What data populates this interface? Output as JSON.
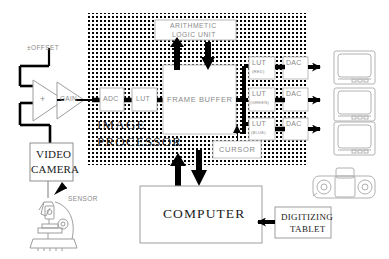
{
  "diagram": {
    "type": "block-diagram",
    "colors": {
      "line": "#000000",
      "stipple": "#000000",
      "box_fill": "#ffffff",
      "faint_text": "#8a8a8a",
      "illustration": "#9a9a9a"
    }
  },
  "input_chain": {
    "offset_label": "±OFFSET",
    "sum_amp_label": "+",
    "gain_amp_label": "GAIN",
    "camera_label_line1": "VIDEO",
    "camera_label_line2": "CAMERA",
    "sensor_label": "SENSOR",
    "microscope_name": "microscope-illustration"
  },
  "image_processor": {
    "label_line1": "IMAGE",
    "label_line2": "PROCESSOR",
    "adc_label": "ADC",
    "input_lut_label": "LUT",
    "frame_buffer_label": "FRAME BUFFER",
    "alu_label_line1": "ARITHMETIC",
    "alu_label_line2": "LOGIC UNIT",
    "cursor_label": "CURSOR",
    "output_channels": [
      {
        "lut_label": "LUT",
        "color_label": "(RED)",
        "dac_label": "DAC"
      },
      {
        "lut_label": "LUT",
        "color_label": "(GREEN)",
        "dac_label": "DAC"
      },
      {
        "lut_label": "LUT",
        "color_label": "(BLUE)",
        "dac_label": "DAC"
      }
    ]
  },
  "displays": [
    {
      "name": "monitor-red"
    },
    {
      "name": "monitor-green"
    },
    {
      "name": "monitor-blue"
    }
  ],
  "host": {
    "computer_label": "COMPUTER",
    "tablet_label_line1": "DIGITIZING",
    "tablet_label_line2": "TABLET",
    "peripheral_name": "tablet-puck-illustration"
  }
}
